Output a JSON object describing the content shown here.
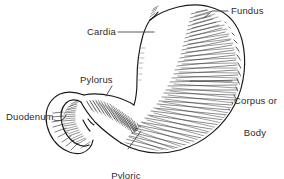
{
  "figure": {
    "style": "black-and-white pen-and-ink hatched medical illustration",
    "background_color": "#ffffff",
    "ink_color": "#1a1a1a",
    "text_color": "#2b2b2b",
    "width": 284,
    "height": 179
  },
  "labels": {
    "fundus": {
      "text": "Fundus",
      "align": "left",
      "x": 231,
      "y": 6
    },
    "cardia": {
      "text": "Cardia",
      "align": "right",
      "x": 86,
      "y": 28
    },
    "corpus": {
      "line1": "Corpus or",
      "line2": "Body",
      "align": "left",
      "x": 234,
      "y": 76
    },
    "pylorus": {
      "text": "Pylorus",
      "align": "left",
      "x": 94,
      "y": 74
    },
    "duodenum": {
      "text": "Duodenum",
      "align": "left",
      "x": 6,
      "y": 112
    },
    "pyloric_antrum": {
      "line1": "Pyloric",
      "line2": "antrum",
      "align": "center",
      "x": 120,
      "y": 152
    }
  },
  "regions": [
    "Fundus",
    "Cardia",
    "Corpus or Body",
    "Pylorus",
    "Duodenum",
    "Pyloric antrum"
  ]
}
